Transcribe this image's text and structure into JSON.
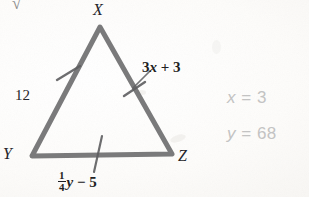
{
  "figure": {
    "type": "isosceles-triangle-diagram",
    "vertices": [
      {
        "name": "X",
        "label": "X",
        "x": 100,
        "y": 27
      },
      {
        "name": "Y",
        "label": "Y",
        "x": 32,
        "y": 156
      },
      {
        "name": "Z",
        "label": "Z",
        "x": 172,
        "y": 154
      }
    ],
    "stroke_color": "#6f6f70",
    "stroke_width": 5,
    "tick_color": "#5e5e60",
    "sides": [
      {
        "name": "XY",
        "label": "12",
        "tick_marks": 1
      },
      {
        "name": "XZ",
        "label": "3x + 3",
        "tick_marks": 1
      },
      {
        "name": "YZ",
        "label": "1/4 y - 5",
        "tick_marks": 1
      }
    ]
  },
  "labels": {
    "vertex_x": "X",
    "vertex_y": "Y",
    "vertex_z": "Z",
    "side_xy_length": "12",
    "side_xz_expr_coef": "3",
    "side_xz_expr_var": "x",
    "side_xz_expr_rest": "+ 3",
    "side_yz_frac_num": "1",
    "side_yz_frac_den": "4",
    "side_yz_expr_var": "y",
    "side_yz_expr_rest": "− 5",
    "top_partial_mark": "√"
  },
  "answers": {
    "color": "#c3c3c3",
    "x_var": "x",
    "x_eq": "=",
    "x_value": "3",
    "y_var": "y",
    "y_eq": "=",
    "y_value": "68"
  }
}
